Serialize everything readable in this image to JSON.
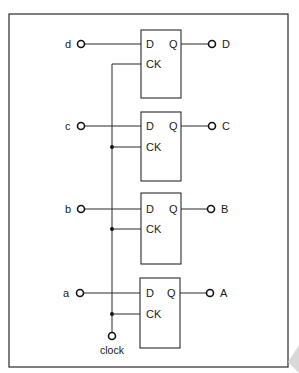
{
  "diagram": {
    "colors": {
      "stroke": "#2a2a2a",
      "background": "#ffffff",
      "frame": "#3a3a3a",
      "corner_artifact": "#d8d8d8"
    },
    "flipflops": [
      {
        "input_label": "d",
        "output_label": "D",
        "pin_d": "D",
        "pin_q": "Q",
        "pin_ck": "CK"
      },
      {
        "input_label": "c",
        "output_label": "C",
        "pin_d": "D",
        "pin_q": "Q",
        "pin_ck": "CK"
      },
      {
        "input_label": "b",
        "output_label": "B",
        "pin_d": "D",
        "pin_q": "Q",
        "pin_ck": "CK"
      },
      {
        "input_label": "a",
        "output_label": "A",
        "pin_d": "D",
        "pin_q": "Q",
        "pin_ck": "CK"
      }
    ],
    "clock_label": "clock"
  }
}
